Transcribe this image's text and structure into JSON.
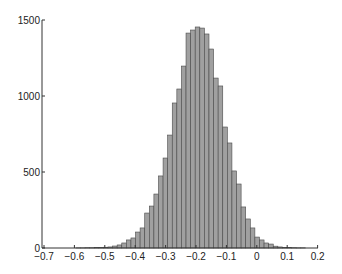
{
  "chart_data": {
    "type": "bar",
    "title": "",
    "xlabel": "",
    "ylabel": "",
    "xlim": [
      -0.7,
      0.2
    ],
    "ylim": [
      0,
      1500
    ],
    "grid": false,
    "legend": null,
    "x_ticks": [
      "-0.7",
      "-0.6",
      "-0.5",
      "-0.4",
      "-0.3",
      "-0.2",
      "-0.1",
      "0",
      "0.1",
      "0.2"
    ],
    "y_ticks": [
      "0",
      "500",
      "1000",
      "1500"
    ],
    "bin_width": 0.0151,
    "bin_start": -0.5952,
    "bar_color": "#a0a0a0",
    "edge_color": "#4a4a4a",
    "values": [
      1,
      1,
      2,
      2,
      3,
      4,
      5,
      7,
      13,
      20,
      33,
      53,
      66,
      105,
      132,
      230,
      276,
      355,
      474,
      592,
      743,
      954,
      1046,
      1197,
      1414,
      1434,
      1454,
      1447,
      1408,
      1309,
      1118,
      1066,
      796,
      691,
      507,
      421,
      270,
      191,
      132,
      72,
      53,
      33,
      26,
      12,
      7,
      4,
      3,
      2,
      1,
      1
    ]
  }
}
